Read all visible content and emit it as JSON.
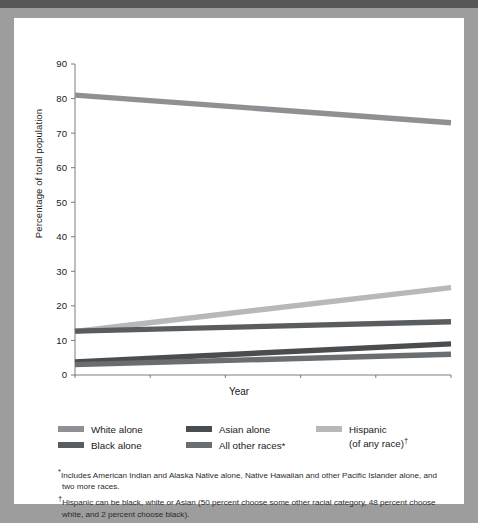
{
  "figure": {
    "background_color": "#9d9d9d",
    "card_color": "#ffffff",
    "top_band_color": "#555759"
  },
  "chart_data": {
    "type": "line",
    "title": "",
    "xlabel": "Year",
    "ylabel": "Percentage of total population",
    "xlim": [
      2000,
      2050
    ],
    "ylim": [
      0,
      90
    ],
    "xticks": [
      "2000",
      "2010",
      "2020",
      "2030",
      "2040",
      "2050"
    ],
    "yticks": [
      "0",
      "10",
      "20",
      "30",
      "40",
      "50",
      "60",
      "70",
      "80",
      "90"
    ],
    "grid": false,
    "legend_position": "below-axes",
    "x": [
      2000,
      2050
    ],
    "series": [
      {
        "name": "White alone",
        "values": [
          81,
          73
        ],
        "color": "#8e9093",
        "legend_col": 0,
        "legend_row": 0
      },
      {
        "name": "Black alone",
        "values": [
          12.7,
          15.4
        ],
        "color": "#5a5d60",
        "legend_col": 0,
        "legend_row": 1
      },
      {
        "name": "Asian alone",
        "values": [
          3.8,
          9.0
        ],
        "color": "#4a4d50",
        "legend_col": 1,
        "legend_row": 0
      },
      {
        "name": "All other races*",
        "values": [
          3.0,
          6.0
        ],
        "color": "#6b6e71",
        "legend_col": 1,
        "legend_row": 1
      },
      {
        "name": "Hispanic",
        "values": [
          12.6,
          25.3
        ],
        "color": "#b6b8ba",
        "legend_col": 2,
        "legend_row": 0
      }
    ]
  },
  "legend": {
    "items": [
      {
        "label": "White alone",
        "sub": ""
      },
      {
        "label": "Black alone",
        "sub": ""
      },
      {
        "label": "Asian alone",
        "sub": ""
      },
      {
        "label": "All other races*",
        "sub": ""
      },
      {
        "label": "Hispanic",
        "sub": "(of any race)"
      }
    ]
  },
  "footnotes": {
    "marker_1": "*",
    "text_1": "Includes American Indian and Alaska Native alone, Native Hawaiian and other Pacific Islander alone, and two more races.",
    "marker_2": "†",
    "text_2": "Hispanic can be black, white or Asian (50 percent choose some other racial category, 48 percent choose white, and 2 percent choose black)."
  }
}
